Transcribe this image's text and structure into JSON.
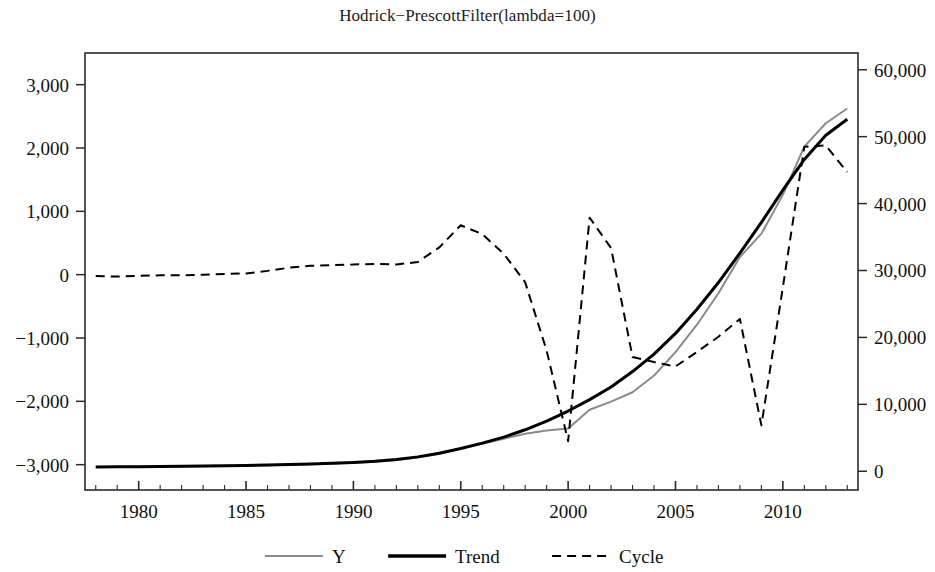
{
  "chart_data": {
    "type": "line",
    "title": "Hodrick−PrescottFilter(lambda=100)",
    "xlabel": "",
    "ylabel": "",
    "grid": false,
    "legend_position": "bottom-center",
    "x": [
      1978,
      1979,
      1980,
      1981,
      1982,
      1983,
      1984,
      1985,
      1986,
      1987,
      1988,
      1989,
      1990,
      1991,
      1992,
      1993,
      1994,
      1995,
      1996,
      1997,
      1998,
      1999,
      2000,
      2001,
      2002,
      2003,
      2004,
      2005,
      2006,
      2007,
      2008,
      2009,
      2010,
      2011,
      2012,
      2013
    ],
    "xlim": [
      1977.5,
      2013.5
    ],
    "xticks": [
      1980,
      1985,
      1990,
      1995,
      2000,
      2005,
      2010
    ],
    "xtick_labels": [
      "1980",
      "1985",
      "1990",
      "1995",
      "2000",
      "2005",
      "2010"
    ],
    "xminor_step": 1,
    "left_axis": {
      "ylim": [
        -3400,
        3500
      ],
      "yticks": [
        3000,
        2000,
        1000,
        0,
        -1000,
        -2000,
        -3000
      ],
      "ytick_labels": [
        "3,000",
        "2,000",
        "1,000",
        "0",
        "−1,000",
        "−2,000",
        "−3,000"
      ],
      "series": [
        "Cycle"
      ]
    },
    "right_axis": {
      "ylim": [
        -2800,
        62500
      ],
      "yticks": [
        60000,
        50000,
        40000,
        30000,
        20000,
        10000,
        0
      ],
      "ytick_labels": [
        "60,000",
        "50,000",
        "40,000",
        "30,000",
        "20,000",
        "10,000",
        "0"
      ],
      "series": [
        "Y",
        "Trend"
      ]
    },
    "series": [
      {
        "name": "Y",
        "axis": "right",
        "style": "solid",
        "color": "#8a8a8a",
        "width": 2,
        "values": [
          620,
          640,
          660,
          690,
          720,
          760,
          800,
          850,
          910,
          980,
          1060,
          1150,
          1260,
          1420,
          1680,
          2050,
          2600,
          3380,
          4100,
          4850,
          5600,
          6100,
          6400,
          9200,
          10400,
          11800,
          14300,
          17800,
          21900,
          26600,
          32000,
          35500,
          41300,
          48500,
          52000,
          54200
        ]
      },
      {
        "name": "Trend",
        "axis": "right",
        "style": "solid",
        "color": "#000000",
        "width": 3,
        "values": [
          640,
          660,
          680,
          710,
          740,
          780,
          820,
          870,
          930,
          1000,
          1080,
          1180,
          1310,
          1490,
          1760,
          2150,
          2700,
          3400,
          4200,
          5100,
          6200,
          7500,
          9000,
          10700,
          12600,
          14900,
          17500,
          20600,
          24200,
          28200,
          32600,
          37200,
          42000,
          46600,
          50200,
          52600
        ]
      },
      {
        "name": "Cycle",
        "axis": "left",
        "style": "dashed",
        "color": "#000000",
        "width": 2,
        "values": [
          -20,
          -30,
          -20,
          -10,
          -10,
          0,
          10,
          20,
          60,
          110,
          140,
          150,
          160,
          170,
          160,
          200,
          430,
          780,
          640,
          330,
          -120,
          -1200,
          -2630,
          900,
          420,
          -1300,
          -1380,
          -1450,
          -1220,
          -980,
          -700,
          -2380,
          -200,
          2020,
          2040,
          1620
        ]
      }
    ],
    "legend": [
      {
        "label": "Y",
        "style": "solid",
        "color": "#8a8a8a",
        "width": 2
      },
      {
        "label": "Trend",
        "style": "solid",
        "color": "#000000",
        "width": 3.5
      },
      {
        "label": "Cycle",
        "style": "dashed",
        "color": "#000000",
        "width": 2
      }
    ]
  }
}
